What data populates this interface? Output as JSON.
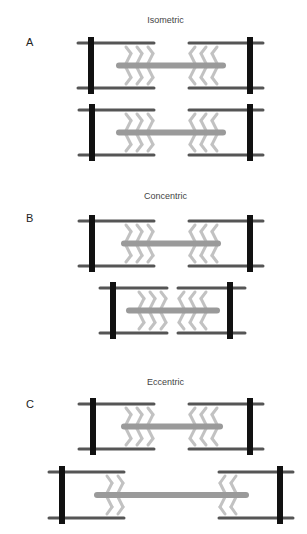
{
  "panels": [
    {
      "label": "A",
      "title": "Isometric",
      "label_pos": [
        26,
        36
      ],
      "title_pos": 15,
      "sarcomeres": [
        {
          "zl": 91,
          "zr": 250,
          "yt": 43,
          "yb": 88,
          "al": [
            78,
            154
          ],
          "ar": [
            189,
            263
          ],
          "m": [
            119,
            223
          ]
        },
        {
          "zl": 92,
          "zr": 250,
          "yt": 110,
          "yb": 155,
          "al": [
            79,
            154
          ],
          "ar": [
            189,
            263
          ],
          "m": [
            119,
            223
          ]
        }
      ]
    },
    {
      "label": "B",
      "title": "Concentric",
      "label_pos": [
        26,
        212
      ],
      "title_pos": 191,
      "sarcomeres": [
        {
          "zl": 92,
          "zr": 250,
          "yt": 221,
          "yb": 266,
          "al": [
            79,
            154
          ],
          "ar": [
            189,
            263
          ],
          "m": [
            124,
            218
          ]
        },
        {
          "zl": 113,
          "zr": 230,
          "yt": 288,
          "yb": 333,
          "al": [
            100,
            167
          ],
          "ar": [
            178,
            245
          ],
          "m": [
            129,
            217
          ]
        }
      ]
    },
    {
      "label": "C",
      "title": "Eccentric",
      "label_pos": [
        26,
        398
      ],
      "title_pos": 377,
      "sarcomeres": [
        {
          "zl": 93,
          "zr": 250,
          "yt": 404,
          "yb": 449,
          "al": [
            79,
            154
          ],
          "ar": [
            189,
            263
          ],
          "m": [
            124,
            220
          ]
        },
        {
          "zl": 62,
          "zr": 280,
          "yt": 472,
          "yb": 518,
          "al": [
            49,
            124
          ],
          "ar": [
            219,
            293
          ],
          "m": [
            97,
            246
          ]
        }
      ]
    }
  ],
  "colors": {
    "z_line": "#111111",
    "actin": "#555555",
    "myosin": "#9a9a9a",
    "cross_bridge": "#c2c2c2"
  }
}
